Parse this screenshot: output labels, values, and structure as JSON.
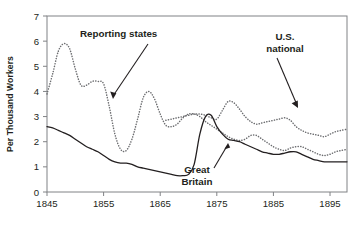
{
  "chart_data": {
    "type": "line",
    "title": "",
    "xlabel": "",
    "ylabel": "Per Thousand Workers",
    "xlim": [
      1845,
      1898
    ],
    "ylim": [
      0,
      7
    ],
    "xticks": [
      1845,
      1855,
      1865,
      1875,
      1885,
      1895
    ],
    "xtick_labels": [
      "1845",
      "1855",
      "1865",
      "1875",
      "1885",
      "1895"
    ],
    "yticks": [
      0,
      1,
      2,
      3,
      4,
      5,
      6,
      7
    ],
    "ytick_labels": [
      "0",
      "1",
      "2",
      "3",
      "4",
      "5",
      "6",
      "7"
    ],
    "grid": false,
    "legend_position": "annotations",
    "annotations": [
      {
        "label": "Reporting states",
        "target_series": "Reporting states"
      },
      {
        "label": "U.S.\nnational",
        "target_series": "U.S. national"
      },
      {
        "label": "Great\nBritain",
        "target_series": "Great Britain"
      }
    ],
    "series": [
      {
        "name": "Reporting states",
        "style": "dotted",
        "color": "#6d6e71",
        "x": [
          1845,
          1846,
          1847,
          1848,
          1849,
          1850,
          1851,
          1852,
          1853,
          1854,
          1855,
          1856,
          1857,
          1858,
          1859,
          1860,
          1861,
          1862,
          1863,
          1864,
          1865,
          1866,
          1867,
          1868,
          1869,
          1870,
          1871,
          1872,
          1873,
          1874,
          1875,
          1876,
          1877,
          1878,
          1879,
          1880,
          1881,
          1882,
          1883,
          1884,
          1885,
          1886,
          1887,
          1888,
          1889,
          1890,
          1891,
          1892,
          1893,
          1894,
          1895,
          1896,
          1897,
          1898
        ],
        "y": [
          3.9,
          4.7,
          5.6,
          5.9,
          5.7,
          4.9,
          4.25,
          4.25,
          4.4,
          4.4,
          4.3,
          3.4,
          2.3,
          1.7,
          1.65,
          2.1,
          2.9,
          3.75,
          4.0,
          3.7,
          3.1,
          2.65,
          2.6,
          2.7,
          2.95,
          3.1,
          3.1,
          3.0,
          2.8,
          2.65,
          2.5,
          2.35,
          2.2,
          2.1,
          2.05,
          2.1,
          2.25,
          2.25,
          2.1,
          1.95,
          1.8,
          1.7,
          1.65,
          1.75,
          1.8,
          1.8,
          1.7,
          1.6,
          1.5,
          1.45,
          1.5,
          1.6,
          1.65,
          1.7
        ]
      },
      {
        "name": "U.S. national",
        "style": "dotted",
        "color": "#6d6e71",
        "x": [
          1866,
          1867,
          1868,
          1869,
          1870,
          1871,
          1872,
          1873,
          1874,
          1875,
          1876,
          1877,
          1878,
          1879,
          1880,
          1881,
          1882,
          1883,
          1884,
          1885,
          1886,
          1887,
          1888,
          1889,
          1890,
          1891,
          1892,
          1893,
          1894,
          1895,
          1896,
          1897,
          1898
        ],
        "y": [
          2.85,
          2.9,
          2.95,
          3.0,
          3.05,
          3.1,
          3.1,
          3.05,
          2.95,
          2.9,
          3.25,
          3.6,
          3.55,
          3.3,
          3.0,
          2.8,
          2.7,
          2.75,
          2.8,
          2.85,
          2.9,
          2.95,
          2.85,
          2.6,
          2.45,
          2.35,
          2.3,
          2.25,
          2.2,
          2.3,
          2.4,
          2.45,
          2.5
        ]
      },
      {
        "name": "Great Britain",
        "style": "solid",
        "color": "#231f20",
        "x": [
          1845,
          1846,
          1847,
          1848,
          1849,
          1850,
          1851,
          1852,
          1853,
          1854,
          1855,
          1856,
          1857,
          1858,
          1859,
          1860,
          1861,
          1862,
          1863,
          1864,
          1865,
          1866,
          1867,
          1868,
          1869,
          1870,
          1871,
          1872,
          1873,
          1874,
          1875,
          1876,
          1877,
          1878,
          1879,
          1880,
          1881,
          1882,
          1883,
          1884,
          1885,
          1886,
          1887,
          1888,
          1889,
          1890,
          1891,
          1892,
          1893,
          1894,
          1895,
          1896,
          1897,
          1898
        ],
        "y": [
          2.6,
          2.55,
          2.45,
          2.35,
          2.25,
          2.1,
          1.95,
          1.8,
          1.7,
          1.6,
          1.45,
          1.3,
          1.2,
          1.15,
          1.15,
          1.1,
          1.0,
          0.95,
          0.9,
          0.85,
          0.8,
          0.75,
          0.7,
          0.65,
          0.65,
          0.7,
          1.1,
          2.3,
          3.0,
          3.05,
          2.6,
          2.3,
          2.1,
          2.05,
          2.0,
          1.9,
          1.8,
          1.7,
          1.6,
          1.55,
          1.5,
          1.5,
          1.55,
          1.6,
          1.6,
          1.5,
          1.4,
          1.3,
          1.25,
          1.2,
          1.2,
          1.2,
          1.2,
          1.2
        ]
      }
    ]
  },
  "axis": {
    "y_title": "Per Thousand Workers"
  },
  "annotations": {
    "reporting_states": "Reporting states",
    "us_national_line1": "U.S.",
    "us_national_line2": "national",
    "great_britain_line1": "Great",
    "great_britain_line2": "Britain"
  }
}
